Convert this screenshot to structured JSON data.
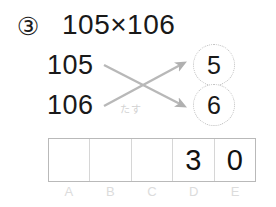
{
  "problem": {
    "number_marker": "③",
    "expression": "105×106",
    "operands": [
      {
        "value": "105"
      },
      {
        "value": "106"
      }
    ],
    "cross_note": "たす",
    "circled_digits": [
      {
        "value": "5"
      },
      {
        "value": "6"
      }
    ]
  },
  "answer_table": {
    "cells": [
      {
        "label": "A",
        "value": ""
      },
      {
        "label": "B",
        "value": ""
      },
      {
        "label": "C",
        "value": ""
      },
      {
        "label": "D",
        "value": "3"
      },
      {
        "label": "E",
        "value": "0"
      }
    ]
  },
  "colors": {
    "ink": "#191919",
    "arrow": "#b0b0b0",
    "table_border": "#b9b9b9",
    "label_gray": "#dcdcdc",
    "circle_border": "#bdbdbd"
  }
}
